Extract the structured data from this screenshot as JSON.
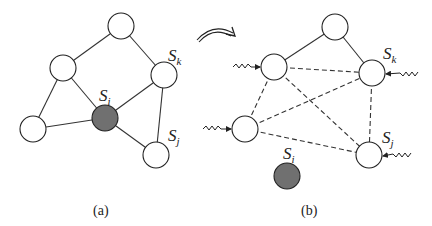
{
  "panels": [
    {
      "caption": "(a)",
      "nodes": [
        {
          "id": "top",
          "x": 121,
          "y": 26,
          "shaded": false
        },
        {
          "id": "upper-left",
          "x": 63,
          "y": 68,
          "shaded": false
        },
        {
          "id": "sk",
          "x": 164,
          "y": 75,
          "shaded": false,
          "label": "S",
          "sub": "k"
        },
        {
          "id": "si",
          "x": 105,
          "y": 118,
          "shaded": true,
          "label": "S",
          "sub": "i"
        },
        {
          "id": "lower-left",
          "x": 33,
          "y": 129,
          "shaded": false
        },
        {
          "id": "sj",
          "x": 156,
          "y": 155,
          "shaded": false,
          "label": "S",
          "sub": "j"
        }
      ]
    },
    {
      "caption": "(b)",
      "nodes": [
        {
          "id": "top",
          "x": 335,
          "y": 27,
          "shaded": false
        },
        {
          "id": "upper-left",
          "x": 274,
          "y": 67,
          "shaded": false
        },
        {
          "id": "sk",
          "x": 372,
          "y": 73,
          "shaded": false,
          "label": "S",
          "sub": "k"
        },
        {
          "id": "mid-left",
          "x": 245,
          "y": 129,
          "shaded": false
        },
        {
          "id": "sj",
          "x": 369,
          "y": 155,
          "shaded": false,
          "label": "S",
          "sub": "j"
        },
        {
          "id": "si",
          "x": 287,
          "y": 176,
          "shaded": true,
          "label": "S",
          "sub": "i"
        }
      ]
    }
  ],
  "labels": {
    "a": {
      "sk": {
        "main": "S",
        "sub": "k"
      },
      "si": {
        "main": "S",
        "sub": "i"
      },
      "sj": {
        "main": "S",
        "sub": "j"
      }
    },
    "b": {
      "sk": {
        "main": "S",
        "sub": "k"
      },
      "si": {
        "main": "S",
        "sub": "i"
      },
      "sj": {
        "main": "S",
        "sub": "j"
      }
    }
  },
  "captions": {
    "a": "(a)",
    "b": "(b)"
  },
  "colors": {
    "node_fill": "#ffffff",
    "shaded_fill": "#707070",
    "stroke": "#222222"
  }
}
